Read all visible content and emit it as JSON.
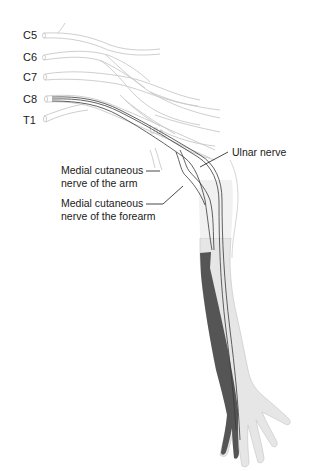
{
  "figure": {
    "colors": {
      "background": "#ffffff",
      "outline": "#c8c8c8",
      "arm_fill": "#e6e6e6",
      "shaded_region": "#555555",
      "nerve": "#3a3a3a",
      "text": "#1a1a1a"
    }
  },
  "roots": [
    {
      "label": "C5"
    },
    {
      "label": "C6"
    },
    {
      "label": "C7"
    },
    {
      "label": "C8"
    },
    {
      "label": "T1"
    }
  ],
  "annotations": {
    "ulnar": "Ulnar nerve",
    "mcn_arm_line1": "Medial cutaneous",
    "mcn_arm_line2": "nerve of the arm",
    "mcn_forearm_line1": "Medial cutaneous",
    "mcn_forearm_line2": "nerve of the forearm"
  }
}
